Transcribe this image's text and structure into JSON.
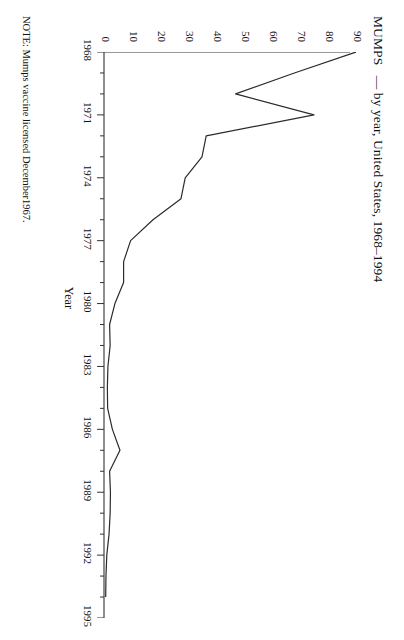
{
  "figure": {
    "title_main": "MUMPS",
    "title_rest": "— by year, United States, 1968–1994",
    "note": "NOTE: Mumps vaccine licensed December1967."
  },
  "chart_data": {
    "type": "line",
    "xlabel": "Year",
    "ylabel": "Reported Cases per  100,000 Population",
    "xlim": [
      1968,
      1995
    ],
    "ylim": [
      0,
      90
    ],
    "xticks": [
      1968,
      1971,
      1974,
      1977,
      1980,
      1983,
      1986,
      1989,
      1992,
      1995
    ],
    "xtick_labels": [
      "1968",
      "1971",
      "1974",
      "1977",
      "1980",
      "1983",
      "1986",
      "1989",
      "1992",
      "1995"
    ],
    "xminorticks": [
      1969,
      1970,
      1972,
      1973,
      1975,
      1976,
      1978,
      1979,
      1981,
      1982,
      1984,
      1985,
      1987,
      1988,
      1990,
      1991,
      1993,
      1994
    ],
    "yticks": [
      0,
      10,
      20,
      30,
      40,
      50,
      60,
      70,
      80,
      90
    ],
    "ytick_labels": [
      "0",
      "10",
      "20",
      "30",
      "40",
      "50",
      "60",
      "70",
      "80",
      "90"
    ],
    "grid": false,
    "legend": false,
    "orientation": "rotated-90-clockwise",
    "x": [
      1968,
      1969,
      1970,
      1971,
      1972,
      1973,
      1974,
      1975,
      1976,
      1977,
      1978,
      1979,
      1980,
      1981,
      1982,
      1983,
      1984,
      1985,
      1986,
      1987,
      1988,
      1989,
      1990,
      1991,
      1992,
      1993,
      1994
    ],
    "values": [
      90.0,
      68.0,
      47.0,
      75.0,
      36.5,
      35.0,
      29.0,
      27.5,
      17.5,
      9.5,
      7.0,
      7.0,
      3.9,
      2.0,
      2.2,
      1.4,
      1.2,
      1.3,
      3.0,
      5.7,
      2.0,
      2.3,
      2.2,
      1.8,
      1.0,
      0.7,
      0.6
    ],
    "data_label_units": "cases per 100,000 population"
  }
}
